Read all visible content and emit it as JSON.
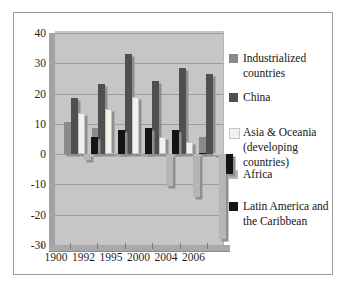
{
  "chart_data": {
    "type": "bar",
    "effect": "3d-column",
    "title": "",
    "xlabel": "",
    "ylabel": "",
    "categories": [
      "1900",
      "1992",
      "1995",
      "2000",
      "2004",
      "2006"
    ],
    "series": [
      {
        "name": "Industrialized countries",
        "color": "#8a8a8a",
        "values": [
          10.5,
          8.5,
          8,
          7.5,
          7,
          5.5
        ]
      },
      {
        "name": "China",
        "color": "#4f4f4f",
        "values": [
          18.5,
          23,
          33,
          24,
          28.5,
          26.5
        ]
      },
      {
        "name": "Asia & Oceania (developing countries)",
        "color": "#f2f1ea",
        "values": [
          13.5,
          15,
          19,
          5.5,
          4,
          0.5
        ]
      },
      {
        "name": "Africa",
        "color": "#b5b5b5",
        "values": [
          -2,
          0.5,
          0.5,
          -10.5,
          -14,
          -28
        ]
      },
      {
        "name": "Latin America and the Caribbean",
        "color": "#141414",
        "values": [
          5.5,
          8,
          8.5,
          8,
          0.5,
          -6.5
        ]
      }
    ],
    "ylim": [
      -30,
      40
    ],
    "ytick_step": 10,
    "ytick_labels": [
      "40",
      "30",
      "20",
      "10",
      "0",
      "-10",
      "-20",
      "-30"
    ],
    "grid": true,
    "legend_position": "right",
    "colors": {
      "plot_background": "#c6c6c6",
      "side_wall": "#a2a2a2",
      "floor": "#a9a9a9",
      "gridline": "#9c9c9c",
      "bar_shadow": "#8f8f8f",
      "frame_border": "#9b9b9b",
      "text": "#1f1f1f"
    }
  }
}
